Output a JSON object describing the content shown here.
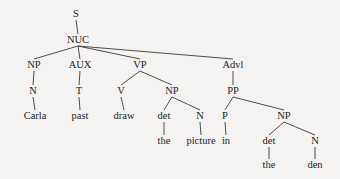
{
  "diagram": {
    "type": "syntax-tree",
    "nodes": [
      {
        "id": "S",
        "label": "S",
        "x": 76,
        "y": 17
      },
      {
        "id": "NUC",
        "label": "NUC",
        "x": 78,
        "y": 43
      },
      {
        "id": "NP1",
        "label": "NP",
        "x": 34,
        "y": 68
      },
      {
        "id": "AUX",
        "label": "AUX",
        "x": 80,
        "y": 68
      },
      {
        "id": "VP",
        "label": "VP",
        "x": 140,
        "y": 68
      },
      {
        "id": "Advl",
        "label": "Advl",
        "x": 233,
        "y": 68
      },
      {
        "id": "N1",
        "label": "N",
        "x": 33,
        "y": 94
      },
      {
        "id": "T",
        "label": "T",
        "x": 79,
        "y": 94
      },
      {
        "id": "V",
        "label": "V",
        "x": 121,
        "y": 94
      },
      {
        "id": "NP2",
        "label": "NP",
        "x": 172,
        "y": 94
      },
      {
        "id": "PP",
        "label": "PP",
        "x": 233,
        "y": 94
      },
      {
        "id": "Carla",
        "label": "Carla",
        "x": 35,
        "y": 119
      },
      {
        "id": "past",
        "label": "past",
        "x": 80,
        "y": 119
      },
      {
        "id": "draw",
        "label": "draw",
        "x": 124,
        "y": 119
      },
      {
        "id": "det1",
        "label": "det",
        "x": 164,
        "y": 119
      },
      {
        "id": "N2",
        "label": "N",
        "x": 200,
        "y": 119
      },
      {
        "id": "P",
        "label": "P",
        "x": 225,
        "y": 119
      },
      {
        "id": "NP3",
        "label": "NP",
        "x": 284,
        "y": 119
      },
      {
        "id": "the1",
        "label": "the",
        "x": 164,
        "y": 144
      },
      {
        "id": "picture",
        "label": "picture",
        "x": 201,
        "y": 144
      },
      {
        "id": "in",
        "label": "in",
        "x": 226,
        "y": 144
      },
      {
        "id": "det2",
        "label": "det",
        "x": 269,
        "y": 144
      },
      {
        "id": "N3",
        "label": "N",
        "x": 315,
        "y": 144
      },
      {
        "id": "the2",
        "label": "the",
        "x": 269,
        "y": 168
      },
      {
        "id": "den",
        "label": "den",
        "x": 315,
        "y": 168
      }
    ],
    "edges": [
      [
        "S",
        "NUC"
      ],
      [
        "NUC",
        "NP1"
      ],
      [
        "NUC",
        "AUX"
      ],
      [
        "NUC",
        "VP"
      ],
      [
        "NUC",
        "Advl"
      ],
      [
        "NP1",
        "N1"
      ],
      [
        "N1",
        "Carla"
      ],
      [
        "AUX",
        "T"
      ],
      [
        "T",
        "past"
      ],
      [
        "VP",
        "V"
      ],
      [
        "VP",
        "NP2"
      ],
      [
        "V",
        "draw"
      ],
      [
        "NP2",
        "det1"
      ],
      [
        "NP2",
        "N2"
      ],
      [
        "det1",
        "the1"
      ],
      [
        "N2",
        "picture"
      ],
      [
        "Advl",
        "PP"
      ],
      [
        "PP",
        "P"
      ],
      [
        "PP",
        "NP3"
      ],
      [
        "P",
        "in"
      ],
      [
        "NP3",
        "det2"
      ],
      [
        "NP3",
        "N3"
      ],
      [
        "det2",
        "the2"
      ],
      [
        "N3",
        "den"
      ]
    ]
  }
}
